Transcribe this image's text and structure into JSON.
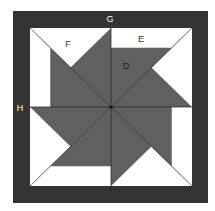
{
  "diagram": {
    "colors": {
      "border": "#333333",
      "fabric_dark": "#606060",
      "fabric_light": "#ffffff",
      "seam": "#222222",
      "label_on_dark": "#ffffff",
      "label_on_light": "#333333"
    },
    "labels": {
      "G": "G",
      "H": "H",
      "F": "F",
      "E": "E",
      "D": "D"
    }
  }
}
